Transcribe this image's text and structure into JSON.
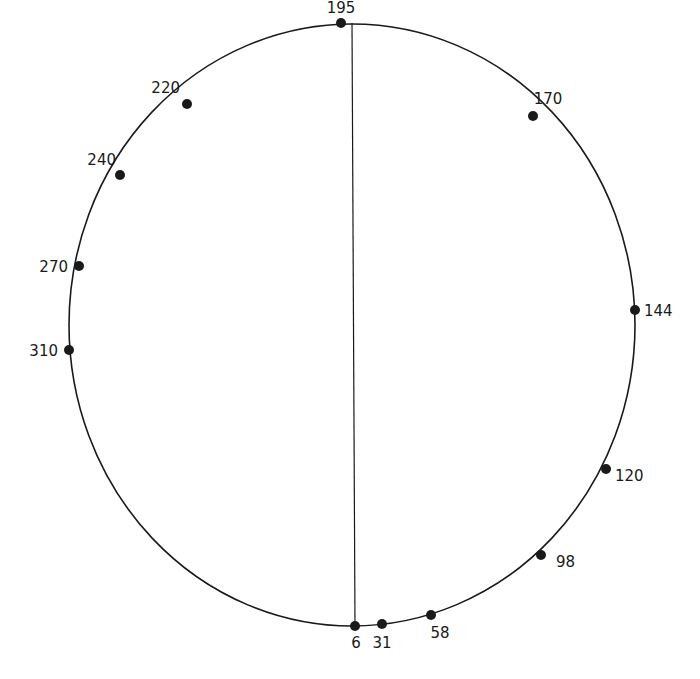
{
  "diagram": {
    "type": "circular-marker-diagram",
    "stroke_color": "#1a1a1a",
    "outline": {
      "cx": 352,
      "cy": 325,
      "rx": 283,
      "ry": 301
    },
    "divider": {
      "x1": 352,
      "y1": 23,
      "x2": 355,
      "y2": 626
    },
    "points": [
      {
        "label": "195",
        "x": 341,
        "y": 23,
        "lx": 341,
        "ly": 13,
        "anchor": "middle"
      },
      {
        "label": "170",
        "x": 533,
        "y": 116,
        "lx": 548,
        "ly": 104,
        "anchor": "middle"
      },
      {
        "label": "144",
        "x": 635,
        "y": 310,
        "lx": 644,
        "ly": 316,
        "anchor": "start"
      },
      {
        "label": "120",
        "x": 606,
        "y": 469,
        "lx": 615,
        "ly": 481,
        "anchor": "start"
      },
      {
        "label": "98",
        "x": 541,
        "y": 555,
        "lx": 556,
        "ly": 567,
        "anchor": "start"
      },
      {
        "label": "58",
        "x": 431,
        "y": 615,
        "lx": 440,
        "ly": 638,
        "anchor": "middle"
      },
      {
        "label": "31",
        "x": 382,
        "y": 624,
        "lx": 382,
        "ly": 648,
        "anchor": "middle"
      },
      {
        "label": "6",
        "x": 355,
        "y": 626,
        "lx": 356,
        "ly": 648,
        "anchor": "middle"
      },
      {
        "label": "310",
        "x": 69,
        "y": 350,
        "lx": 58,
        "ly": 356,
        "anchor": "end"
      },
      {
        "label": "270",
        "x": 79,
        "y": 266,
        "lx": 68,
        "ly": 272,
        "anchor": "end"
      },
      {
        "label": "240",
        "x": 120,
        "y": 175,
        "lx": 116,
        "ly": 165,
        "anchor": "end"
      },
      {
        "label": "220",
        "x": 187,
        "y": 104,
        "lx": 180,
        "ly": 93,
        "anchor": "end"
      }
    ]
  }
}
